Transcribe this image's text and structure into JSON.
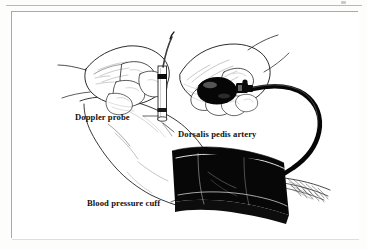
{
  "figure": {
    "kind": "medical-illustration",
    "page_rule": true,
    "frame": {
      "border_color": "#a9a9a9",
      "background": "#ffffff"
    },
    "ink_color": "#000000",
    "paper_color": "#fdfdfc"
  },
  "labels": [
    {
      "id": "doppler-probe",
      "text": "Doppler probe",
      "leader": "points up-right to the probe held against the top of the foot"
    },
    {
      "id": "dorsalis-pedis-artery",
      "text": "Dorsalis pedis artery",
      "leader": "points up-left to the artery on the dorsum of the foot"
    },
    {
      "id": "blood-pressure-cuff",
      "text": "Blood pressure cuff",
      "leader": "points up-right to the cuff wrapped around the ankle"
    }
  ],
  "parts": [
    {
      "id": "doppler-probe",
      "name": "Doppler probe"
    },
    {
      "id": "examiner-left-hand",
      "name": "Hand holding Doppler probe"
    },
    {
      "id": "examiner-right-hand",
      "name": "Hand squeezing inflation bulb"
    },
    {
      "id": "inflation-bulb",
      "name": "Inflation bulb"
    },
    {
      "id": "bulb-valve",
      "name": "Release valve"
    },
    {
      "id": "rubber-tube",
      "name": "Rubber tube"
    },
    {
      "id": "blood-pressure-cuff",
      "name": "Blood pressure cuff"
    },
    {
      "id": "cuff-tail",
      "name": "Cuff fabric tail"
    },
    {
      "id": "foot-and-ankle",
      "name": "Patient foot and ankle"
    }
  ]
}
